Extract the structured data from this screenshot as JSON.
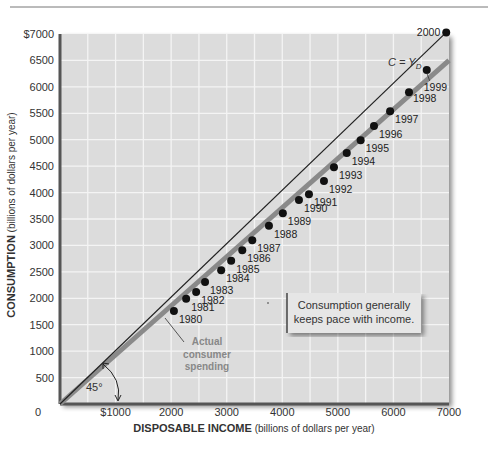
{
  "chart_data": {
    "type": "scatter",
    "title": "",
    "xlabel_bold": "DISPOSABLE INCOME",
    "xlabel_rest": " (billions of dollars per year)",
    "ylabel_bold": "CONSUMPTION",
    "ylabel_rest": " (billions of dollars per year)",
    "xlim": [
      0,
      7000
    ],
    "ylim": [
      0,
      7000
    ],
    "grid": true,
    "x_ticks": [
      {
        "value": 0,
        "label": "0"
      },
      {
        "value": 1000,
        "label": "$1000"
      },
      {
        "value": 2000,
        "label": "2000"
      },
      {
        "value": 3000,
        "label": "3000"
      },
      {
        "value": 4000,
        "label": "4000"
      },
      {
        "value": 5000,
        "label": "5000"
      },
      {
        "value": 6000,
        "label": "6000"
      },
      {
        "value": 7000,
        "label": "7000"
      }
    ],
    "y_ticks": [
      {
        "value": 500,
        "label": "500"
      },
      {
        "value": 1000,
        "label": "1000"
      },
      {
        "value": 1500,
        "label": "1500"
      },
      {
        "value": 2000,
        "label": "2000"
      },
      {
        "value": 2500,
        "label": "2500"
      },
      {
        "value": 3000,
        "label": "3000"
      },
      {
        "value": 3500,
        "label": "3500"
      },
      {
        "value": 4000,
        "label": "4000"
      },
      {
        "value": 4500,
        "label": "4500"
      },
      {
        "value": 5000,
        "label": "5000"
      },
      {
        "value": 5500,
        "label": "5500"
      },
      {
        "value": 6000,
        "label": "6000"
      },
      {
        "value": 6500,
        "label": "6500"
      },
      {
        "value": 7000,
        "label": "$7000"
      }
    ],
    "series": [
      {
        "name": "Actual consumer spending",
        "points": [
          {
            "label": "1980",
            "x": 2050,
            "y": 1760
          },
          {
            "label": "1981",
            "x": 2270,
            "y": 1990
          },
          {
            "label": "1982",
            "x": 2450,
            "y": 2120
          },
          {
            "label": "1983",
            "x": 2610,
            "y": 2310
          },
          {
            "label": "1984",
            "x": 2900,
            "y": 2530
          },
          {
            "label": "1985",
            "x": 3080,
            "y": 2710
          },
          {
            "label": "1986",
            "x": 3280,
            "y": 2910
          },
          {
            "label": "1987",
            "x": 3460,
            "y": 3100
          },
          {
            "label": "1988",
            "x": 3760,
            "y": 3370
          },
          {
            "label": "1989",
            "x": 4010,
            "y": 3610
          },
          {
            "label": "1990",
            "x": 4300,
            "y": 3860
          },
          {
            "label": "1991",
            "x": 4480,
            "y": 3970
          },
          {
            "label": "1992",
            "x": 4750,
            "y": 4220
          },
          {
            "label": "1993",
            "x": 4930,
            "y": 4480
          },
          {
            "label": "1994",
            "x": 5160,
            "y": 4750
          },
          {
            "label": "1995",
            "x": 5410,
            "y": 4990
          },
          {
            "label": "1996",
            "x": 5650,
            "y": 5260
          },
          {
            "label": "1997",
            "x": 5940,
            "y": 5540
          },
          {
            "label": "1998",
            "x": 6280,
            "y": 5900
          },
          {
            "label": "1999",
            "x": 6600,
            "y": 6320
          },
          {
            "label": "2000",
            "x": 6950,
            "y": 7030
          }
        ]
      }
    ],
    "reference_line": {
      "name": "C = YD",
      "label_main": "C = Y",
      "label_sub": "D",
      "from": [
        0,
        0
      ],
      "to": [
        7000,
        7000
      ]
    },
    "trend_line": {
      "name": "Actual consumer spending",
      "from": [
        0,
        0
      ],
      "to": [
        7000,
        6500
      ]
    },
    "annotations": {
      "angle_label": "45°",
      "trend_label_lines": [
        "Actual",
        "consumer",
        "spending"
      ],
      "callout_lines": [
        "Consumption generally",
        "keeps pace with income."
      ]
    },
    "colors": {
      "plot_bg": "#dcdcdc",
      "grid": "#f4f4f4",
      "axis": "#555555",
      "trend": "#8a8a8a",
      "points": "#111111",
      "annotation_text": "#8c8c8c",
      "callout_bg": "#e6e6e6"
    }
  }
}
